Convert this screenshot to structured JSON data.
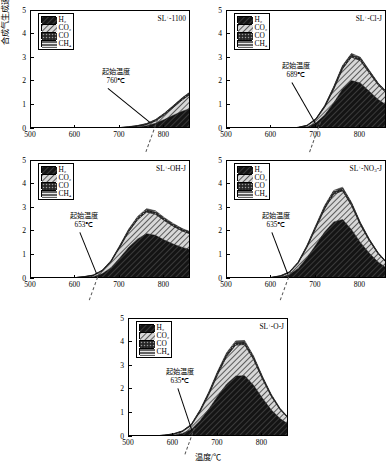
{
  "figure": {
    "axis_labels": {
      "y": "合成气生成速率/[mmol·(min·g)⁻¹]",
      "x": "温度/℃"
    },
    "legend_entries": [
      {
        "label_html": "H₂",
        "key": "H2",
        "pattern": "dense-diagonal-dark"
      },
      {
        "label_html": "CO₂",
        "key": "CO2",
        "pattern": "diagonal-hatch"
      },
      {
        "label_html": "CO",
        "key": "CO",
        "pattern": "cross-dot-dark"
      },
      {
        "label_html": "CH₄",
        "key": "CH4",
        "pattern": "horizontal-lines"
      }
    ],
    "annotation_label": "起始温度",
    "colors": {
      "H2": "#1a1a1a",
      "CO2": "#8a8a8a",
      "CO": "#3a3a3a",
      "CH4": "#555555",
      "axis": "#000000",
      "background": "#ffffff"
    },
    "axis_ranges": {
      "x": [
        500,
        860
      ],
      "y": [
        0,
        5
      ],
      "xticks": [
        500,
        600,
        700,
        800
      ],
      "yticks": [
        0,
        1,
        2,
        3,
        4,
        5
      ]
    }
  },
  "chart_data": [
    {
      "type": "area",
      "panel_id": "a",
      "title": "SL⁺-1100",
      "onset_label": "起始温度",
      "onset_value": "760℃",
      "onset_x": 760,
      "title_parts": {
        "prefix": "SL",
        "sup": "+",
        "suffix": "-1100"
      },
      "xlabel": "",
      "ylabel": "",
      "xlim": [
        500,
        860
      ],
      "ylim": [
        0,
        5
      ],
      "xticks": [
        500,
        600,
        700,
        800
      ],
      "yticks": [
        0,
        1,
        2,
        3,
        4,
        5
      ],
      "x": [
        500,
        520,
        540,
        560,
        580,
        600,
        620,
        640,
        660,
        680,
        700,
        720,
        740,
        760,
        780,
        800,
        820,
        840,
        860
      ],
      "series": [
        {
          "name": "H2",
          "values": [
            0,
            0,
            0,
            0,
            0,
            0,
            0,
            0.01,
            0.02,
            0.03,
            0.04,
            0.06,
            0.09,
            0.14,
            0.24,
            0.4,
            0.58,
            0.75,
            0.88
          ]
        },
        {
          "name": "CO2",
          "values": [
            0,
            0,
            0,
            0,
            0,
            0,
            0,
            0.0,
            0.01,
            0.01,
            0.01,
            0.02,
            0.03,
            0.05,
            0.1,
            0.2,
            0.33,
            0.48,
            0.62
          ]
        },
        {
          "name": "CO",
          "values": [
            0,
            0,
            0,
            0,
            0,
            0,
            0,
            0.0,
            0.0,
            0.01,
            0.01,
            0.01,
            0.02,
            0.03,
            0.04,
            0.05,
            0.06,
            0.07,
            0.08
          ]
        },
        {
          "name": "CH4",
          "values": [
            0,
            0,
            0,
            0,
            0,
            0,
            0,
            0.0,
            0.0,
            0.0,
            0.0,
            0.01,
            0.01,
            0.01,
            0.02,
            0.02,
            0.02,
            0.02,
            0.02
          ]
        }
      ]
    },
    {
      "type": "area",
      "panel_id": "b",
      "title": "SL⁺-Cl-J",
      "onset_label": "起始温度",
      "onset_value": "689℃",
      "onset_x": 689,
      "title_parts": {
        "prefix": "SL",
        "sup": "+",
        "suffix": "-Cl-J"
      },
      "xlabel": "",
      "ylabel": "",
      "xlim": [
        500,
        860
      ],
      "ylim": [
        0,
        5
      ],
      "xticks": [
        500,
        600,
        700,
        800
      ],
      "yticks": [
        0,
        1,
        2,
        3,
        4,
        5
      ],
      "x": [
        500,
        520,
        540,
        560,
        580,
        600,
        620,
        640,
        660,
        680,
        700,
        720,
        740,
        760,
        780,
        800,
        820,
        840,
        860
      ],
      "series": [
        {
          "name": "H2",
          "values": [
            0,
            0,
            0,
            0,
            0,
            0.01,
            0.01,
            0.02,
            0.04,
            0.09,
            0.25,
            0.6,
            1.1,
            1.7,
            2.05,
            1.95,
            1.6,
            1.25,
            1.0
          ]
        },
        {
          "name": "CO2",
          "values": [
            0,
            0,
            0,
            0,
            0,
            0.0,
            0.01,
            0.01,
            0.02,
            0.05,
            0.15,
            0.33,
            0.58,
            0.85,
            1.0,
            0.95,
            0.78,
            0.62,
            0.5
          ]
        },
        {
          "name": "CO",
          "values": [
            0,
            0,
            0,
            0,
            0,
            0.0,
            0.0,
            0.0,
            0.01,
            0.01,
            0.03,
            0.05,
            0.08,
            0.1,
            0.11,
            0.1,
            0.08,
            0.06,
            0.05
          ]
        },
        {
          "name": "CH4",
          "values": [
            0,
            0,
            0,
            0,
            0,
            0.0,
            0.0,
            0.0,
            0.0,
            0.01,
            0.01,
            0.02,
            0.03,
            0.04,
            0.04,
            0.04,
            0.03,
            0.02,
            0.02
          ]
        }
      ]
    },
    {
      "type": "area",
      "panel_id": "c",
      "title": "SL⁺-OH-J",
      "onset_label": "起始温度",
      "onset_value": "653℃",
      "onset_x": 653,
      "title_parts": {
        "prefix": "SL",
        "sup": "+",
        "suffix": "-OH-J"
      },
      "xlabel": "",
      "ylabel": "",
      "xlim": [
        500,
        860
      ],
      "ylim": [
        0,
        5
      ],
      "xticks": [
        500,
        600,
        700,
        800
      ],
      "yticks": [
        0,
        1,
        2,
        3,
        4,
        5
      ],
      "x": [
        500,
        520,
        540,
        560,
        580,
        600,
        620,
        640,
        660,
        680,
        700,
        720,
        740,
        760,
        780,
        800,
        820,
        840,
        860
      ],
      "series": [
        {
          "name": "H2",
          "values": [
            0,
            0,
            0,
            0.01,
            0.02,
            0.04,
            0.06,
            0.1,
            0.22,
            0.48,
            0.9,
            1.35,
            1.7,
            1.92,
            1.85,
            1.65,
            1.48,
            1.34,
            1.24
          ]
        },
        {
          "name": "CO2",
          "values": [
            0,
            0,
            0,
            0.0,
            0.01,
            0.02,
            0.03,
            0.05,
            0.12,
            0.25,
            0.45,
            0.66,
            0.82,
            0.92,
            0.9,
            0.83,
            0.76,
            0.7,
            0.66
          ]
        },
        {
          "name": "CO",
          "values": [
            0,
            0,
            0,
            0.0,
            0.0,
            0.0,
            0.01,
            0.01,
            0.02,
            0.03,
            0.05,
            0.07,
            0.08,
            0.09,
            0.09,
            0.08,
            0.07,
            0.07,
            0.06
          ]
        },
        {
          "name": "CH4",
          "values": [
            0,
            0,
            0,
            0.0,
            0.0,
            0.0,
            0.0,
            0.01,
            0.01,
            0.02,
            0.03,
            0.04,
            0.05,
            0.05,
            0.05,
            0.04,
            0.04,
            0.03,
            0.03
          ]
        }
      ]
    },
    {
      "type": "area",
      "panel_id": "d",
      "title": "SL⁺-NO₃-J",
      "onset_label": "起始温度",
      "onset_value": "635℃",
      "onset_x": 635,
      "title_parts": {
        "prefix": "SL",
        "sup": "+",
        "suffix": "-NO",
        "sub": "3",
        "tail": "-J"
      },
      "xlabel": "",
      "ylabel": "",
      "xlim": [
        500,
        860
      ],
      "ylim": [
        0,
        5
      ],
      "xticks": [
        500,
        600,
        700,
        800
      ],
      "yticks": [
        0,
        1,
        2,
        3,
        4,
        5
      ],
      "x": [
        500,
        520,
        540,
        560,
        580,
        600,
        620,
        640,
        660,
        680,
        700,
        720,
        740,
        760,
        780,
        800,
        820,
        840,
        860
      ],
      "series": [
        {
          "name": "H2",
          "values": [
            0,
            0,
            0,
            0.01,
            0.02,
            0.04,
            0.08,
            0.18,
            0.45,
            0.9,
            1.45,
            2.0,
            2.42,
            2.52,
            2.1,
            1.55,
            1.1,
            0.72,
            0.45
          ]
        },
        {
          "name": "CO2",
          "values": [
            0,
            0,
            0,
            0.0,
            0.01,
            0.02,
            0.04,
            0.09,
            0.22,
            0.45,
            0.72,
            0.98,
            1.18,
            1.22,
            1.02,
            0.75,
            0.53,
            0.35,
            0.22
          ]
        },
        {
          "name": "CO",
          "values": [
            0,
            0,
            0,
            0.0,
            0.0,
            0.01,
            0.01,
            0.02,
            0.03,
            0.05,
            0.07,
            0.09,
            0.1,
            0.1,
            0.09,
            0.07,
            0.05,
            0.03,
            0.02
          ]
        },
        {
          "name": "CH4",
          "values": [
            0,
            0,
            0,
            0.0,
            0.0,
            0.0,
            0.01,
            0.01,
            0.02,
            0.03,
            0.04,
            0.05,
            0.05,
            0.05,
            0.04,
            0.03,
            0.02,
            0.02,
            0.01
          ]
        }
      ]
    },
    {
      "type": "area",
      "panel_id": "e",
      "title": "SL⁺-O-J",
      "onset_label": "起始温度",
      "onset_value": "635℃",
      "onset_x": 635,
      "title_parts": {
        "prefix": "SL",
        "sup": "+",
        "suffix": "-O-J"
      },
      "xlabel": "温度/℃",
      "ylabel": "",
      "xlim": [
        500,
        860
      ],
      "ylim": [
        0,
        5
      ],
      "xticks": [
        500,
        600,
        700,
        800
      ],
      "yticks": [
        0,
        1,
        2,
        3,
        4,
        5
      ],
      "x": [
        500,
        520,
        540,
        560,
        580,
        600,
        620,
        640,
        660,
        680,
        700,
        720,
        740,
        760,
        780,
        800,
        820,
        840,
        860
      ],
      "series": [
        {
          "name": "H2",
          "values": [
            0.02,
            0.02,
            0.03,
            0.04,
            0.05,
            0.08,
            0.15,
            0.32,
            0.7,
            1.2,
            1.75,
            2.25,
            2.58,
            2.6,
            2.2,
            1.65,
            1.15,
            0.78,
            0.52
          ]
        },
        {
          "name": "CO2",
          "values": [
            0.0,
            0.0,
            0.01,
            0.01,
            0.02,
            0.04,
            0.08,
            0.17,
            0.38,
            0.62,
            0.92,
            1.18,
            1.32,
            1.32,
            1.1,
            0.82,
            0.58,
            0.38,
            0.25
          ]
        },
        {
          "name": "CO",
          "values": [
            0.0,
            0.0,
            0.0,
            0.0,
            0.01,
            0.01,
            0.02,
            0.03,
            0.05,
            0.07,
            0.09,
            0.1,
            0.11,
            0.11,
            0.09,
            0.07,
            0.05,
            0.03,
            0.02
          ]
        },
        {
          "name": "CH4",
          "values": [
            0.0,
            0.0,
            0.0,
            0.0,
            0.0,
            0.01,
            0.01,
            0.02,
            0.03,
            0.04,
            0.05,
            0.05,
            0.06,
            0.06,
            0.05,
            0.04,
            0.03,
            0.02,
            0.01
          ]
        }
      ]
    }
  ]
}
